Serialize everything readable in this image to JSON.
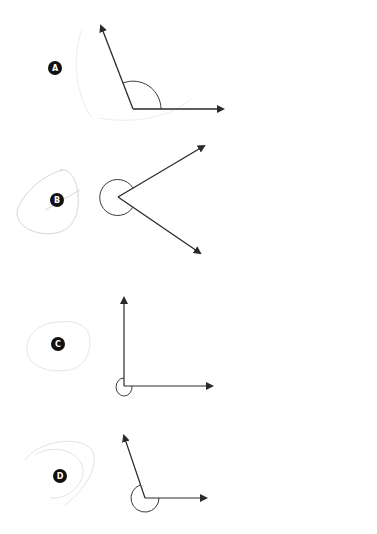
{
  "diagram": {
    "type": "angle-identification",
    "colors": {
      "line": "#2a2a2a",
      "arc": "#3a3a3a",
      "label_bg": "#111111",
      "label_text": "#ffffff",
      "scribble": "#d6d6d6"
    },
    "items": [
      {
        "label": "A",
        "angle_kind": "obtuse",
        "arc": "interior"
      },
      {
        "label": "B",
        "angle_kind": "reflex",
        "arc": "exterior"
      },
      {
        "label": "C",
        "angle_kind": "reflex (270°)",
        "arc": "exterior"
      },
      {
        "label": "D",
        "angle_kind": "reflex",
        "arc": "exterior"
      }
    ]
  }
}
